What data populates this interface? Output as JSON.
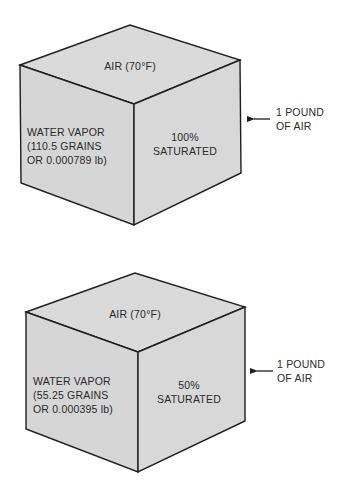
{
  "colors": {
    "face_fill": "#d9d9d9",
    "line": "#1e1e1e",
    "text": "#2a2a2a",
    "background": "#ffffff"
  },
  "cubes": [
    {
      "top_label": "AIR (70°F)",
      "left_face": {
        "line1": "WATER VAPOR",
        "line2": "(110.5 GRAINS",
        "line3": "OR 0.000789 lb)"
      },
      "right_face": {
        "line1": "100%",
        "line2": "SATURATED"
      },
      "callout": {
        "line1": "1 POUND",
        "line2": "OF AIR",
        "icon": "arrow-left-icon"
      }
    },
    {
      "top_label": "AIR (70°F)",
      "left_face": {
        "line1": "WATER VAPOR",
        "line2": "(55.25 GRAINS",
        "line3": "OR 0.000395 lb)"
      },
      "right_face": {
        "line1": "50%",
        "line2": "SATURATED"
      },
      "callout": {
        "line1": "1 POUND",
        "line2": "OF AIR",
        "icon": "arrow-left-icon"
      }
    }
  ]
}
